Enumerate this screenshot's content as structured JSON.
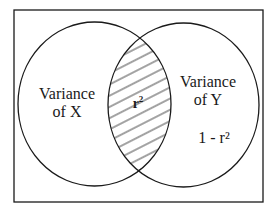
{
  "diagram": {
    "type": "venn",
    "title": "",
    "sets": [
      {
        "id": "x",
        "label_line1": "Variance",
        "label_line2": "of X"
      },
      {
        "id": "y",
        "label_line1": "Variance",
        "label_line2": "of Y",
        "extra": "1 - r²"
      }
    ],
    "overlap": {
      "label": "r",
      "superscript": "2",
      "fill": "hatched"
    },
    "colors": {
      "stroke": "#1a1a1a",
      "background": "#ffffff"
    }
  }
}
